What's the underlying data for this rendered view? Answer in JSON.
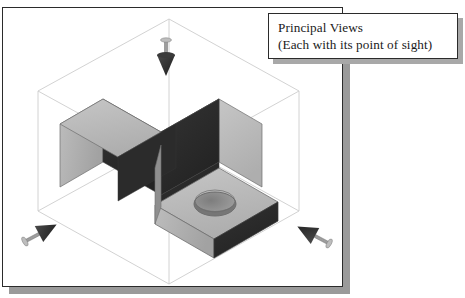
{
  "figure": {
    "kind": "isometric-glass-box-projection-diagram",
    "caption": {
      "line1": "Principal Views",
      "line2": "(Each with its point of sight)"
    },
    "frame": {
      "border_color": "#2b2b2b",
      "background": "#ffffff",
      "shadow_color": "#9a9a9a"
    }
  },
  "glass_box": {
    "label": "transparent projection box",
    "line_color": "#c9c9c9",
    "vertices": {
      "top_back": "168,18",
      "left_top": "37,90",
      "right_top": "298,90",
      "center_top": "168,160",
      "left_bottom": "37,205",
      "right_bottom": "298,205",
      "front_bottom": "188,283"
    }
  },
  "part": {
    "label": "L-shaped bracket with drilled hole",
    "features": [
      "vertical back wall",
      "horizontal base plate",
      "through hole"
    ],
    "shading": {
      "light_face": "#b9b9b9",
      "mid_face": "#9b9b9b",
      "dark_face": "#2c2c2c",
      "edge": "#6f6f6f",
      "hole_bore": "#8c8c8c"
    }
  },
  "sight_arrows": [
    {
      "id": "top-view-arrow",
      "name": "point-of-sight-top",
      "direction": "down",
      "x": 163,
      "y": 42
    },
    {
      "id": "left-view-arrow",
      "name": "point-of-sight-left",
      "direction": "up-right",
      "x": 38,
      "y": 230
    },
    {
      "id": "right-view-arrow",
      "name": "point-of-sight-right",
      "direction": "up-left",
      "x": 310,
      "y": 232
    }
  ]
}
